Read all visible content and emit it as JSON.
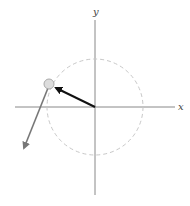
{
  "diagram": {
    "axes": {
      "x_label": "x",
      "y_label": "y"
    },
    "circle": {
      "style": "dashed",
      "color": "#c8c8c8"
    },
    "vectors": [
      {
        "name": "radius-vector",
        "color": "#111111",
        "from": "origin",
        "to": "particle"
      },
      {
        "name": "velocity-vector",
        "color": "#777777",
        "from": "particle",
        "direction": "down-left"
      }
    ],
    "particle": {
      "color": "#d8d8d8"
    }
  }
}
